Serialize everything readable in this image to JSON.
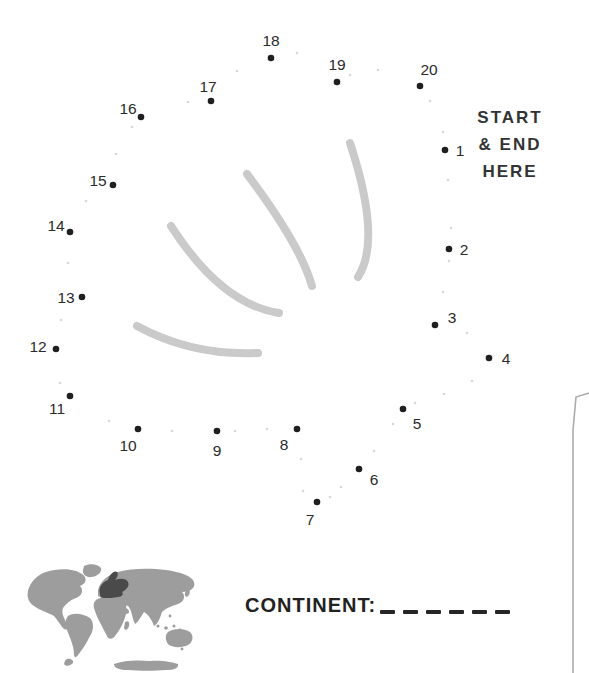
{
  "puzzle": {
    "start_end": {
      "line1": "START",
      "line2": "& END",
      "line3": "HERE"
    },
    "dots": [
      {
        "n": "1",
        "x": 445,
        "y": 150,
        "lx": 460,
        "ly": 150
      },
      {
        "n": "2",
        "x": 449,
        "y": 249,
        "lx": 464,
        "ly": 249
      },
      {
        "n": "3",
        "x": 435,
        "y": 325,
        "lx": 452,
        "ly": 317
      },
      {
        "n": "4",
        "x": 489,
        "y": 358,
        "lx": 506,
        "ly": 358
      },
      {
        "n": "5",
        "x": 403,
        "y": 409,
        "lx": 417,
        "ly": 423
      },
      {
        "n": "6",
        "x": 359,
        "y": 469,
        "lx": 374,
        "ly": 479
      },
      {
        "n": "7",
        "x": 317,
        "y": 502,
        "lx": 310,
        "ly": 519
      },
      {
        "n": "8",
        "x": 297,
        "y": 429,
        "lx": 284,
        "ly": 444
      },
      {
        "n": "9",
        "x": 217,
        "y": 431,
        "lx": 217,
        "ly": 450
      },
      {
        "n": "10",
        "x": 138,
        "y": 429,
        "lx": 128,
        "ly": 445
      },
      {
        "n": "11",
        "x": 70,
        "y": 396,
        "lx": 57,
        "ly": 408
      },
      {
        "n": "12",
        "x": 56,
        "y": 349,
        "lx": 38,
        "ly": 346
      },
      {
        "n": "13",
        "x": 82,
        "y": 297,
        "lx": 66,
        "ly": 297
      },
      {
        "n": "14",
        "x": 70,
        "y": 232,
        "lx": 56,
        "ly": 225
      },
      {
        "n": "15",
        "x": 113,
        "y": 185,
        "lx": 98,
        "ly": 180
      },
      {
        "n": "16",
        "x": 141,
        "y": 117,
        "lx": 128,
        "ly": 108
      },
      {
        "n": "17",
        "x": 211,
        "y": 101,
        "lx": 208,
        "ly": 86
      },
      {
        "n": "18",
        "x": 271,
        "y": 58,
        "lx": 271,
        "ly": 40
      },
      {
        "n": "19",
        "x": 337,
        "y": 82,
        "lx": 337,
        "ly": 64
      },
      {
        "n": "20",
        "x": 420,
        "y": 86,
        "lx": 429,
        "ly": 69
      }
    ],
    "faint_dots": [
      [
        237,
        71
      ],
      [
        297,
        53
      ],
      [
        350,
        75
      ],
      [
        378,
        70
      ],
      [
        430,
        101
      ],
      [
        443,
        132
      ],
      [
        448,
        180
      ],
      [
        451,
        228
      ],
      [
        449,
        261
      ],
      [
        443,
        292
      ],
      [
        467,
        333
      ],
      [
        472,
        381
      ],
      [
        444,
        394
      ],
      [
        415,
        403
      ],
      [
        393,
        424
      ],
      [
        374,
        451
      ],
      [
        341,
        487
      ],
      [
        330,
        497
      ],
      [
        303,
        491
      ],
      [
        301,
        459
      ],
      [
        267,
        429
      ],
      [
        235,
        431
      ],
      [
        172,
        431
      ],
      [
        109,
        421
      ],
      [
        60,
        383
      ],
      [
        61,
        320
      ],
      [
        68,
        263
      ],
      [
        86,
        201
      ],
      [
        116,
        154
      ],
      [
        132,
        127
      ],
      [
        188,
        102
      ]
    ],
    "interior_curves": [
      "M350,143 Q382,240 358,277",
      "M247,174 Q300,244 312,286",
      "M171,226 Q221,304 279,313",
      "M137,326 Q192,356 258,353"
    ],
    "colors": {
      "dot": "#1f1f1f",
      "label": "#2b2b2b",
      "curve": "#cacaca",
      "faint_dot": "#d9d9d9"
    }
  },
  "footer": {
    "continent_label": "CONTINENT:",
    "answer_blank_count": 6,
    "map": {
      "land_color": "#9d9d9d",
      "highlight_color": "#4a4a4a",
      "highlighted_region": "europe"
    }
  },
  "artifact": {
    "edge_line_color": "#9c9c9c"
  }
}
